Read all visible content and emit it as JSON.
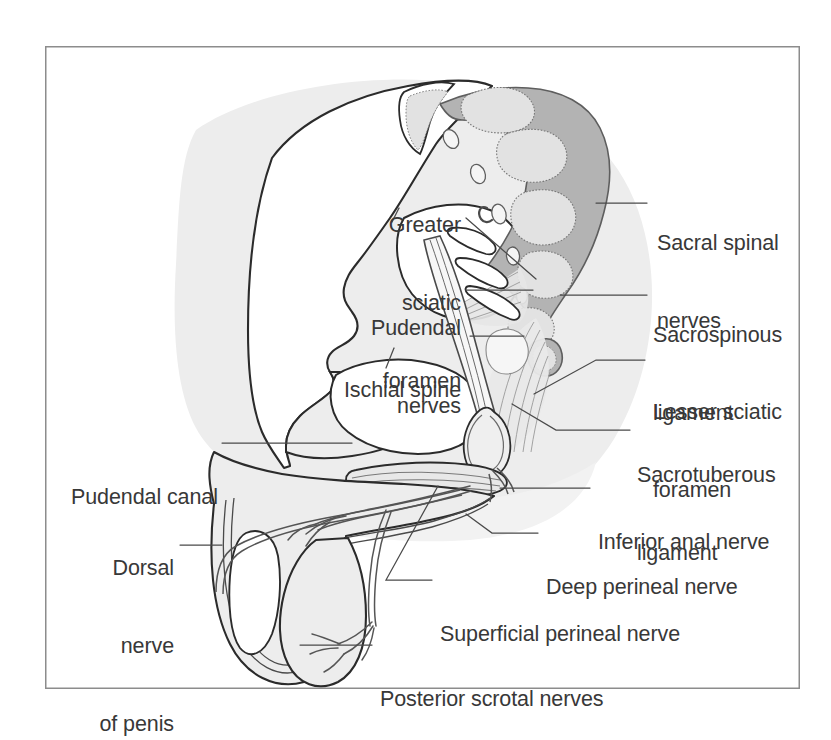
{
  "figure": {
    "frame": {
      "x": 45,
      "y": 46,
      "width": 755,
      "height": 643,
      "border_color": "#8c8c8c",
      "background_color": "#ffffff"
    },
    "palette": {
      "outline": "#2b2b2b",
      "leader_line": "#4a4a4a",
      "text": "#383838",
      "shadow_fill": "#ededed",
      "bone_fill": "#ffffff",
      "soft_tissue_fill": "#efefef",
      "sacrum_band": "#b3b3b3",
      "vertebra_fill": "#e2e2e2",
      "ligament_fill": "#e8e8e8",
      "nerve_fill": "#f4f4f4"
    }
  },
  "labels": [
    {
      "id": "greater-sciatic-foramen",
      "lines": [
        "Greater",
        "sciatic",
        "foramen"
      ],
      "text": "Greater sciatic foramen",
      "align": "right",
      "x": 333,
      "y": 160,
      "width": 128,
      "leader": "M 466 218 L 536 279"
    },
    {
      "id": "pudendal-nerves",
      "lines": [
        "Pudendal",
        "nerves"
      ],
      "text": "Pudendal nerves",
      "align": "right",
      "x": 335,
      "y": 263,
      "width": 126,
      "leader": "M 466 290 L 533 290"
    },
    {
      "id": "ischial-spine",
      "lines": [
        "Ischial spine"
      ],
      "text": "Ischial spine",
      "align": "right",
      "x": 325,
      "y": 325,
      "width": 136,
      "leader": "M 470 336 L 524 336"
    },
    {
      "id": "pudendal-canal",
      "lines": [
        "Pudendal canal"
      ],
      "text": "Pudendal canal",
      "align": "right",
      "x": 71,
      "y": 432,
      "width": 145,
      "leader": "M 222 443 L 352 443"
    },
    {
      "id": "dorsal-nerve-of-penis",
      "lines": [
        "Dorsal",
        "nerve",
        "of penis"
      ],
      "text": "Dorsal nerve of penis",
      "align": "right",
      "x": 76,
      "y": 503,
      "width": 98,
      "leader": "M 180 545 L 199 545"
    },
    {
      "id": "sacral-spinal-nerves",
      "lines": [
        "Sacral spinal",
        "nerves"
      ],
      "text": "Sacral spinal nerves",
      "align": "left",
      "x": 657,
      "y": 178,
      "width": 150,
      "leader": "M 647 203 L 618 203"
    },
    {
      "id": "sacrospinous-ligament",
      "lines": [
        "Sacrospinous",
        "ligament"
      ],
      "text": "Sacrospinous ligament",
      "align": "left",
      "x": 653,
      "y": 270,
      "width": 160,
      "leader": "M 647 295 L 566 295"
    },
    {
      "id": "lesser-sciatic-foramen",
      "lines": [
        "Lesser sciatic",
        "foramen"
      ],
      "text": "Lesser sciatic foramen",
      "align": "left",
      "x": 653,
      "y": 347,
      "width": 160,
      "leader": "M 645 360 L 594 360 L 559 377"
    },
    {
      "id": "sacrotuberous-ligament",
      "lines": [
        "Sacrotuberous",
        "ligament"
      ],
      "text": "Sacrotuberous ligament",
      "align": "left",
      "x": 637,
      "y": 410,
      "width": 168,
      "leader": "M 630 430 L 553 430 L 513 405"
    },
    {
      "id": "inferior-anal-nerve",
      "lines": [
        "Inferior anal nerve"
      ],
      "text": "Inferior anal nerve",
      "align": "left",
      "x": 598,
      "y": 477,
      "width": 188,
      "leader": "M 590 488 L 497 488"
    },
    {
      "id": "deep-perineal-nerve",
      "lines": [
        "Deep perineal nerve"
      ],
      "text": "Deep perineal nerve",
      "align": "left",
      "x": 546,
      "y": 522,
      "width": 196,
      "leader": "M 538 533 L 490 533 L 471 517"
    },
    {
      "id": "superficial-perineal-nerve",
      "lines": [
        "Superficial perineal nerve"
      ],
      "text": "Superficial perineal nerve",
      "align": "left",
      "x": 440,
      "y": 569,
      "width": 252,
      "leader": "M 432 580 L 380 580 L 428 487"
    },
    {
      "id": "posterior-scrotal-nerves",
      "lines": [
        "Posterior scrotal nerves"
      ],
      "text": "Posterior scrotal nerves",
      "align": "left",
      "x": 380,
      "y": 634,
      "width": 236,
      "leader": "M 372 645 L 292 645"
    }
  ]
}
